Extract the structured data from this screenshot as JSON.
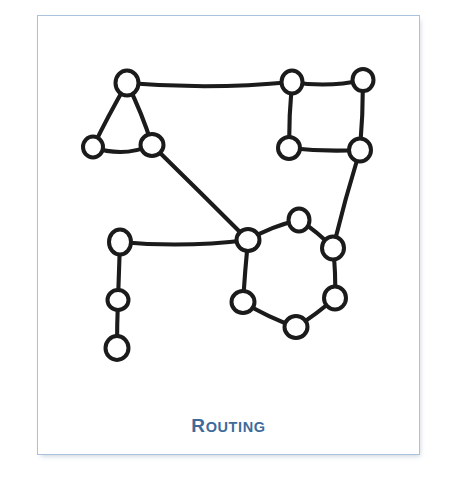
{
  "figure": {
    "caption": "ROUTING",
    "caption_initial": "R",
    "caption_rest": "OUTING",
    "caption_color": "#3f6b9b",
    "border_color": "#a9c3dc",
    "background_color": "#ffffff",
    "ink_color": "#1b1b1b",
    "style": "hand-drawn network / graph sketch",
    "card": {
      "x": 37,
      "y": 15,
      "width": 383,
      "height": 440
    }
  },
  "chart_data": {
    "type": "diagram",
    "subtype": "node-link graph",
    "title": "ROUTING",
    "node_count": 15,
    "edge_count": 17,
    "node_style": {
      "shape": "hollow-circle",
      "fill": "#ffffff",
      "stroke": "#1b1b1b",
      "radius": 11
    },
    "edge_style": {
      "stroke": "#1b1b1b",
      "width": 4.1,
      "curved": "slightly hand-drawn"
    },
    "nodes": [
      {
        "id": "t-top",
        "label": "",
        "x": 127,
        "y": 83,
        "rx": 11.5,
        "ry": 12.5,
        "group": "triangle"
      },
      {
        "id": "t-left",
        "label": "",
        "x": 93,
        "y": 147,
        "rx": 10.0,
        "ry": 10.5,
        "group": "triangle"
      },
      {
        "id": "t-right",
        "label": "",
        "x": 152,
        "y": 145,
        "rx": 11.5,
        "ry": 11.0,
        "group": "triangle"
      },
      {
        "id": "s-tl",
        "label": "",
        "x": 292,
        "y": 82,
        "rx": 10.5,
        "ry": 11.5,
        "group": "square"
      },
      {
        "id": "s-tr",
        "label": "",
        "x": 363,
        "y": 80,
        "rx": 10.5,
        "ry": 11.0,
        "group": "square"
      },
      {
        "id": "s-bl",
        "label": "",
        "x": 289,
        "y": 148,
        "rx": 11.0,
        "ry": 11.0,
        "group": "square"
      },
      {
        "id": "s-br",
        "label": "",
        "x": 360,
        "y": 150,
        "rx": 11.0,
        "ry": 11.5,
        "group": "square"
      },
      {
        "id": "h-hub",
        "label": "",
        "x": 248,
        "y": 240,
        "rx": 11.5,
        "ry": 11.0,
        "group": "hexagon"
      },
      {
        "id": "h-top",
        "label": "",
        "x": 299,
        "y": 220,
        "rx": 10.5,
        "ry": 11.5,
        "group": "hexagon"
      },
      {
        "id": "h-ru",
        "label": "",
        "x": 333,
        "y": 248,
        "rx": 11.0,
        "ry": 11.5,
        "group": "hexagon"
      },
      {
        "id": "h-rl",
        "label": "",
        "x": 335,
        "y": 298,
        "rx": 11.0,
        "ry": 11.5,
        "group": "hexagon"
      },
      {
        "id": "h-bot",
        "label": "",
        "x": 296,
        "y": 327,
        "rx": 11.5,
        "ry": 11.0,
        "group": "hexagon"
      },
      {
        "id": "h-ll",
        "label": "",
        "x": 243,
        "y": 302,
        "rx": 11.5,
        "ry": 11.0,
        "group": "hexagon"
      },
      {
        "id": "c-top",
        "label": "",
        "x": 120,
        "y": 242,
        "rx": 11.0,
        "ry": 12.5,
        "group": "chain"
      },
      {
        "id": "c-mid",
        "label": "",
        "x": 118,
        "y": 300,
        "rx": 10.5,
        "ry": 10.0,
        "group": "chain"
      },
      {
        "id": "c-bot",
        "label": "",
        "x": 117,
        "y": 348,
        "rx": 11.5,
        "ry": 12.0,
        "group": "chain"
      }
    ],
    "edges": [
      {
        "from": "t-top",
        "to": "s-tl",
        "path": "M127,83 Q210,90 292,82"
      },
      {
        "from": "s-tl",
        "to": "s-tr",
        "path": "M292,82 Q328,88 363,80"
      },
      {
        "from": "t-top",
        "to": "t-left",
        "path": "M127,83 Q108,116 93,147"
      },
      {
        "from": "t-top",
        "to": "t-right",
        "path": "M127,83 Q142,113 152,145"
      },
      {
        "from": "t-left",
        "to": "t-right",
        "path": "M93,147 Q123,158 152,145"
      },
      {
        "from": "t-right",
        "to": "h-hub",
        "path": "M152,145 Q200,192 248,240"
      },
      {
        "from": "s-tl",
        "to": "s-bl",
        "path": "M292,82 Q289,115 289,148"
      },
      {
        "from": "s-tr",
        "to": "s-br",
        "path": "M363,80 Q363,115 360,150"
      },
      {
        "from": "s-bl",
        "to": "s-br",
        "path": "M289,148 Q325,152 360,150"
      },
      {
        "from": "s-br",
        "to": "h-ru",
        "path": "M360,150 Q345,199 333,248"
      },
      {
        "from": "h-hub",
        "to": "h-top",
        "path": "M248,240 Q272,226 299,220"
      },
      {
        "from": "h-top",
        "to": "h-ru",
        "path": "M299,220 Q318,232 333,248"
      },
      {
        "from": "h-ru",
        "to": "h-rl",
        "path": "M333,248 Q336,273 335,298"
      },
      {
        "from": "h-rl",
        "to": "h-bot",
        "path": "M335,298 Q317,314 296,327"
      },
      {
        "from": "h-bot",
        "to": "h-ll",
        "path": "M296,327 Q269,318 243,302"
      },
      {
        "from": "h-ll",
        "to": "h-hub",
        "path": "M243,302 Q245,271 248,240"
      },
      {
        "from": "h-hub",
        "to": "c-top",
        "path": "M248,240 Q184,248 120,242"
      },
      {
        "from": "c-top",
        "to": "c-mid",
        "path": "M120,242 Q119,271 118,300"
      },
      {
        "from": "c-mid",
        "to": "c-bot",
        "path": "M118,300 Q117,324 117,348"
      }
    ]
  }
}
